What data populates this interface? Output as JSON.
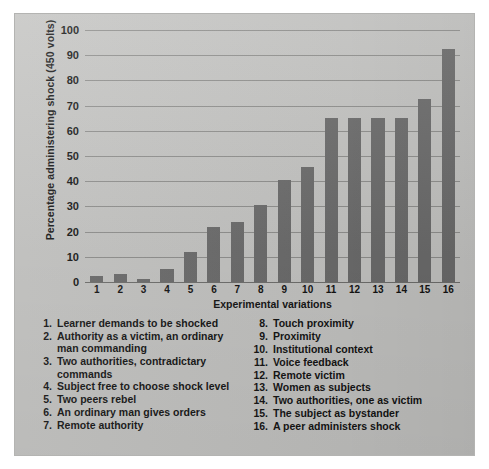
{
  "chart_data": {
    "type": "bar",
    "title": "",
    "subtitle": "",
    "xlabel": "Experimental variations",
    "ylabel": "Percentage administering shock (450 volts)",
    "categories": [
      "1",
      "2",
      "3",
      "4",
      "5",
      "6",
      "7",
      "8",
      "9",
      "10",
      "11",
      "12",
      "13",
      "14",
      "15",
      "16"
    ],
    "values": [
      2.5,
      3,
      1,
      5,
      12,
      22,
      24,
      30.5,
      40.5,
      45.5,
      65,
      65,
      65,
      65,
      72.5,
      92.5
    ],
    "ylim": [
      0,
      100
    ],
    "yticks": [
      0,
      10,
      20,
      30,
      40,
      50,
      60,
      70,
      80,
      90,
      100
    ],
    "grid": true,
    "legend_position": "below-plot",
    "bar_color": "#6b6b6b",
    "background_color": "#c3c3c1",
    "gridline_color": "#8e8e8c",
    "series": [
      {
        "name": "Percentage administering shock (450 volts)",
        "values": [
          2.5,
          3,
          1,
          5,
          12,
          22,
          24,
          30.5,
          40.5,
          45.5,
          65,
          65,
          65,
          65,
          72.5,
          92.5
        ]
      }
    ]
  },
  "legend": {
    "left_column": [
      {
        "num": "1.",
        "text": "Learner demands to be shocked"
      },
      {
        "num": "2.",
        "text": "Authority as a victim, an ordinary man commanding"
      },
      {
        "num": "3.",
        "text": "Two authorities, contradictary commands"
      },
      {
        "num": "4.",
        "text": "Subject free to choose shock level"
      },
      {
        "num": "5.",
        "text": "Two peers rebel"
      },
      {
        "num": "6.",
        "text": "An ordinary man gives orders"
      },
      {
        "num": "7.",
        "text": "Remote authority"
      }
    ],
    "right_column": [
      {
        "num": "8.",
        "text": "Touch proximity"
      },
      {
        "num": "9.",
        "text": "Proximity"
      },
      {
        "num": "10.",
        "text": "Institutional context"
      },
      {
        "num": "11.",
        "text": "Voice feedback"
      },
      {
        "num": "12.",
        "text": "Remote victim"
      },
      {
        "num": "13.",
        "text": "Women as subjects"
      },
      {
        "num": "14.",
        "text": "Two authorities, one as victim"
      },
      {
        "num": "15.",
        "text": "The subject as bystander"
      },
      {
        "num": "16.",
        "text": "A peer administers shock"
      }
    ]
  }
}
